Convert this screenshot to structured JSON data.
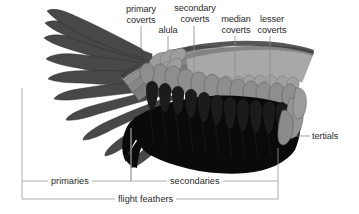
{
  "diagram": {
    "background_color": "#ffffff",
    "text_color": "#2b2b2b",
    "line_color": "#8c8c8c"
  },
  "callouts": [
    {
      "id": "primary-coverts",
      "label": "primary\ncoverts",
      "leader_x": 141,
      "leader_top": 26,
      "leader_bottom": 48,
      "text_x": 108,
      "text_y": 4,
      "align": "center",
      "width": 66
    },
    {
      "id": "alula",
      "label": "alula",
      "leader_x": 168,
      "leader_top": 36,
      "leader_bottom": 52,
      "text_x": 145,
      "text_y": 25,
      "align": "center",
      "width": 46
    },
    {
      "id": "secondary-coverts",
      "label": "secondary\ncoverts",
      "leader_x": 194,
      "leader_top": 26,
      "leader_bottom": 76,
      "text_x": 160,
      "text_y": 3,
      "align": "center",
      "width": 70
    },
    {
      "id": "median-coverts",
      "label": "median\ncoverts",
      "leader_x": 235,
      "leader_top": 36,
      "leader_bottom": 92,
      "text_x": 206,
      "text_y": 14,
      "align": "center",
      "width": 60
    },
    {
      "id": "lesser-coverts",
      "label": "lesser\ncoverts",
      "leader_x": 270,
      "leader_top": 36,
      "leader_bottom": 84,
      "text_x": 245,
      "text_y": 14,
      "align": "center",
      "width": 54
    },
    {
      "id": "tertials",
      "label": "tertials",
      "leader_x": 0,
      "leader_top": 0,
      "leader_bottom": 0,
      "text_x": 312,
      "text_y": 131,
      "align": "left",
      "width": 44
    }
  ],
  "tertials_leader": {
    "x1": 282,
    "y1": 136,
    "x2": 310,
    "y2": 136
  },
  "brackets": [
    {
      "id": "primaries",
      "label": "primaries",
      "line_y": 181,
      "x_start": 22,
      "x_end": 131,
      "tick_left_top": 88,
      "tick_right_top": 128,
      "label_x": 48,
      "label_y": 176
    },
    {
      "id": "secondaries",
      "label": "secondaries",
      "line_y": 181,
      "x_start": 131,
      "x_end": 278,
      "tick_left_top": 128,
      "tick_right_top": 148,
      "label_x": 167,
      "label_y": 176
    },
    {
      "id": "flight-feathers",
      "label": "flight feathers",
      "line_y": 199,
      "x_start": 22,
      "x_end": 278,
      "tick_left_top": 181,
      "tick_right_top": 181,
      "label_x": 115,
      "label_y": 194
    }
  ],
  "feather_groups": {
    "primaries": {
      "name": "primaries",
      "color": "#4a4a4a",
      "outline": "#2a2a2a",
      "count": 10
    },
    "primary_coverts": {
      "name": "primary coverts",
      "color": "#8f8f8f",
      "outline": "#6d6d6d",
      "count": 11
    },
    "alula": {
      "name": "alula",
      "color": "#9a9a9a",
      "outline": "#6a6a6a",
      "count": 5
    },
    "secondary_coverts": {
      "name": "secondary coverts",
      "color": "#8a8a8a",
      "outline": "#5e5e5e",
      "count": 16
    },
    "median_coverts": {
      "name": "median coverts",
      "color": "#9c9c9c",
      "outline": "#6e6e6e",
      "count": 14
    },
    "lesser_coverts": {
      "name": "lesser coverts",
      "color": "#a6a6a6",
      "outline": "#848484",
      "count": 1
    },
    "secondaries": {
      "name": "secondaries",
      "color": "#090909",
      "outline": "#000000",
      "count": 14
    },
    "tertials": {
      "name": "tertials",
      "color": "#8f8f8f",
      "outline": "#5a5a5a",
      "count": 3
    }
  }
}
